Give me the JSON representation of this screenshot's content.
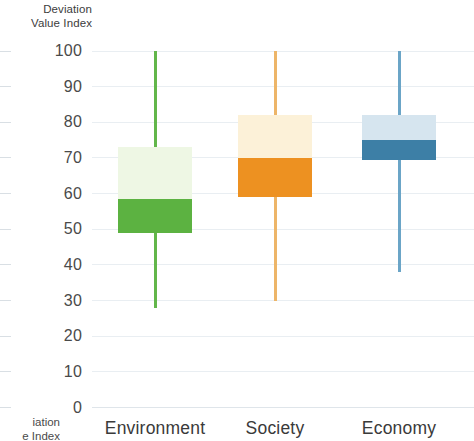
{
  "chart_data": {
    "type": "box",
    "title": "",
    "ylabel": "Deviation\nValue Index",
    "xlabel": "",
    "ylim": [
      0,
      100
    ],
    "yticks": [
      0,
      10,
      20,
      30,
      40,
      50,
      60,
      70,
      80,
      90,
      100
    ],
    "ytick_labels": [
      "0",
      "10",
      "20",
      "30",
      "40",
      "50",
      "60",
      "70",
      "80",
      "90",
      "100"
    ],
    "grid": true,
    "legend": "none",
    "categories": [
      "Environment",
      "Society",
      "Economy"
    ],
    "boxes": [
      {
        "category": "Environment",
        "whisker_low": 28,
        "q1": 49,
        "median": 58.5,
        "q3": 73,
        "whisker_high": 100,
        "color_dark": "#5cb241",
        "color_light": "#eef7e4",
        "color_line": "#62b64a"
      },
      {
        "category": "Society",
        "whisker_low": 30,
        "q1": 59,
        "median": 70,
        "q3": 82,
        "whisker_high": 100,
        "color_dark": "#ed9121",
        "color_light": "#fcf1d8",
        "color_line": "#edb568"
      },
      {
        "category": "Economy",
        "whisker_low": 38,
        "q1": 69.5,
        "median": 75,
        "q3": 82,
        "color_dark": "#3d7fa6",
        "color_light": "#d6e5ef",
        "color_line": "#6ba5c7",
        "whisker_high": 100
      }
    ]
  },
  "axis": {
    "title_line1": "Deviation",
    "title_line2": "Value Index",
    "title_cut_line1": "iation",
    "title_cut_line2": "e Index"
  }
}
